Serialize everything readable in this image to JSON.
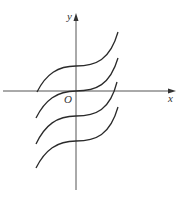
{
  "figure": {
    "type": "coordinate-plane",
    "axes": {
      "x_label": "x",
      "y_label": "y",
      "origin_label": "O"
    },
    "colors": {
      "axis": "#555555",
      "curve": "#2a2a2a",
      "background": "#ffffff"
    },
    "curves": [
      {
        "name": "curve-1",
        "offset_px": -25
      },
      {
        "name": "curve-2",
        "offset_px": 0
      },
      {
        "name": "curve-3",
        "offset_px": 25
      },
      {
        "name": "curve-4",
        "offset_px": 50
      }
    ]
  }
}
